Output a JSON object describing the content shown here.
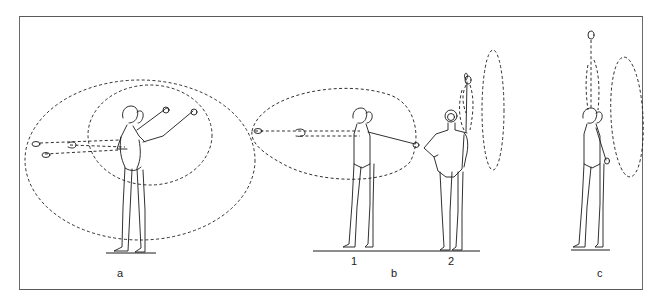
{
  "figure": {
    "panels": [
      {
        "id": "a",
        "label": "a",
        "positions": []
      },
      {
        "id": "b",
        "label": "b",
        "positions": [
          {
            "label": "1"
          },
          {
            "label": "2"
          }
        ]
      },
      {
        "id": "c",
        "label": "c",
        "positions": []
      }
    ]
  }
}
